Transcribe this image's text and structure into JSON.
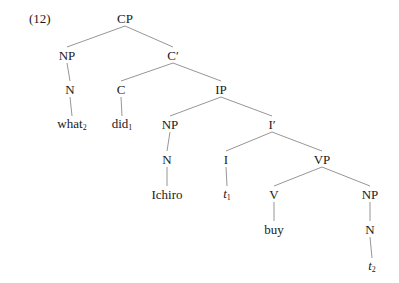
{
  "example_number": "(12)",
  "line_color": "#8a8a8a",
  "text_color": "#1a1a1a",
  "nodes": [
    {
      "id": "cp",
      "label": "CP",
      "sub": "",
      "italic": false,
      "x": 125,
      "y": 18
    },
    {
      "id": "np1",
      "label": "NP",
      "sub": "",
      "italic": false,
      "x": 67,
      "y": 55
    },
    {
      "id": "cbar",
      "label": "C′",
      "sub": "",
      "italic": false,
      "x": 173,
      "y": 55
    },
    {
      "id": "n1",
      "label": "N",
      "sub": "",
      "italic": false,
      "x": 70,
      "y": 89
    },
    {
      "id": "c",
      "label": "C",
      "sub": "",
      "italic": false,
      "x": 121,
      "y": 89
    },
    {
      "id": "ip",
      "label": "IP",
      "sub": "",
      "italic": false,
      "x": 221,
      "y": 89
    },
    {
      "id": "what",
      "label": "what",
      "sub": "2",
      "italic": false,
      "x": 72,
      "y": 124
    },
    {
      "id": "did",
      "label": "did",
      "sub": "1",
      "italic": false,
      "x": 122,
      "y": 124
    },
    {
      "id": "np2",
      "label": "NP",
      "sub": "",
      "italic": false,
      "x": 170,
      "y": 124
    },
    {
      "id": "ibar",
      "label": "I′",
      "sub": "",
      "italic": false,
      "x": 272,
      "y": 124
    },
    {
      "id": "n2",
      "label": "N",
      "sub": "",
      "italic": false,
      "x": 167,
      "y": 159
    },
    {
      "id": "i",
      "label": "I",
      "sub": "",
      "italic": false,
      "x": 226,
      "y": 159
    },
    {
      "id": "vp",
      "label": "VP",
      "sub": "",
      "italic": false,
      "x": 322,
      "y": 159
    },
    {
      "id": "ichiro",
      "label": "Ichiro",
      "sub": "",
      "italic": false,
      "x": 167,
      "y": 194
    },
    {
      "id": "t1",
      "label": "t",
      "sub": "1",
      "italic": true,
      "x": 227,
      "y": 194
    },
    {
      "id": "v",
      "label": "V",
      "sub": "",
      "italic": false,
      "x": 274,
      "y": 194
    },
    {
      "id": "np3",
      "label": "NP",
      "sub": "",
      "italic": false,
      "x": 370,
      "y": 194
    },
    {
      "id": "buy",
      "label": "buy",
      "sub": "",
      "italic": false,
      "x": 274,
      "y": 229
    },
    {
      "id": "n3",
      "label": "N",
      "sub": "",
      "italic": false,
      "x": 370,
      "y": 229
    },
    {
      "id": "t2",
      "label": "t",
      "sub": "2",
      "italic": true,
      "x": 372,
      "y": 266
    }
  ],
  "edges": [
    [
      "cp",
      "np1"
    ],
    [
      "cp",
      "cbar"
    ],
    [
      "np1",
      "n1"
    ],
    [
      "n1",
      "what"
    ],
    [
      "cbar",
      "c"
    ],
    [
      "cbar",
      "ip"
    ],
    [
      "c",
      "did"
    ],
    [
      "ip",
      "np2"
    ],
    [
      "ip",
      "ibar"
    ],
    [
      "np2",
      "n2"
    ],
    [
      "n2",
      "ichiro"
    ],
    [
      "ibar",
      "i"
    ],
    [
      "ibar",
      "vp"
    ],
    [
      "i",
      "t1"
    ],
    [
      "vp",
      "v"
    ],
    [
      "vp",
      "np3"
    ],
    [
      "v",
      "buy"
    ],
    [
      "np3",
      "n3"
    ],
    [
      "n3",
      "t2"
    ]
  ]
}
